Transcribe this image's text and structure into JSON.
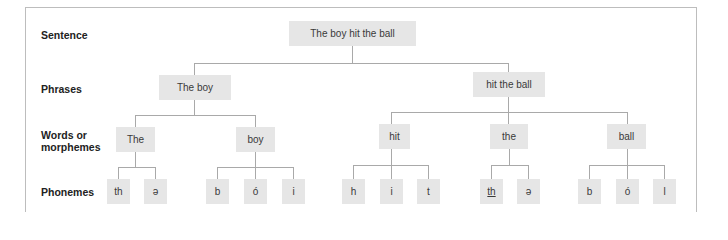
{
  "row_labels": {
    "sentence": "Sentence",
    "phrases": "Phrases",
    "words_line1": "Words or",
    "words_line2": "morphemes",
    "phonemes": "Phonemes"
  },
  "tree": {
    "sentence": "The boy hit the ball",
    "phrases": [
      "The boy",
      "hit the ball"
    ],
    "words": [
      "The",
      "boy",
      "hit",
      "the",
      "ball"
    ],
    "phonemes": {
      "The": [
        "th",
        "ə"
      ],
      "boy": [
        "b",
        "ó",
        "i"
      ],
      "hit": [
        "h",
        "i",
        "t"
      ],
      "the": [
        "th",
        "ə"
      ],
      "ball": [
        "b",
        "ó",
        "l"
      ]
    }
  },
  "colors": {
    "node_fill": "#e6e6e6",
    "connector": "#a9a9a9",
    "frame": "#bdbdbd",
    "label_text": "#222222"
  }
}
